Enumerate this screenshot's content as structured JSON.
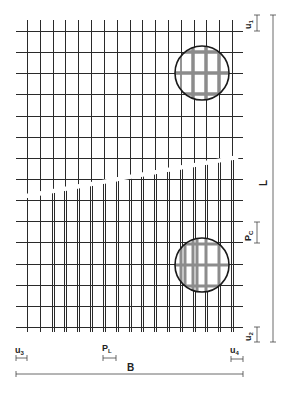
{
  "diagram": {
    "type": "reinforcement-mesh-layout",
    "colors": {
      "bar": "#2a2a2a",
      "detail_bar": "#8c8c8c",
      "dimension": "#444444",
      "background": "#ffffff"
    },
    "mesh": {
      "vertical_bar_count": 17,
      "horizontal_bar_count": 15,
      "has_break_line": true,
      "detail_circles": 2
    },
    "labels": {
      "u1": "u",
      "u1_sub": "1",
      "u2": "u",
      "u2_sub": "2",
      "u3": "u",
      "u3_sub": "3",
      "u4": "u",
      "u4_sub": "4",
      "pc": "P",
      "pc_sub": "C",
      "pl": "P",
      "pl_sub": "L",
      "length": "L",
      "width": "B"
    }
  }
}
